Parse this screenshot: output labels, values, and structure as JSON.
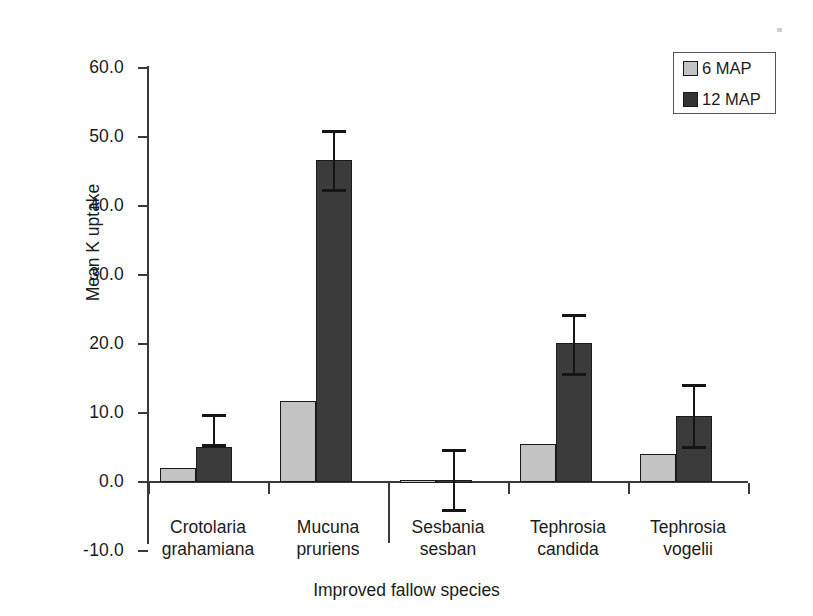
{
  "chart_data": {
    "type": "bar",
    "title": "",
    "xlabel": "Improved fallow species",
    "ylabel": "Mean K uptake",
    "ylim": [
      -10.0,
      60.0
    ],
    "yticks": [
      60.0,
      50.0,
      40.0,
      30.0,
      20.0,
      10.0,
      0.0,
      -10.0
    ],
    "ytick_labels": [
      "60.0",
      "50.0",
      "40.0",
      "30.0",
      "20.0",
      "10.0",
      "0.0",
      "-10.0"
    ],
    "grid": false,
    "legend_position": "top-right",
    "categories": [
      "Crotolaria grahamiana",
      "Mucuna pruriens",
      "Sesbania sesban",
      "Tephrosia candida",
      "Tephrosia vogelii"
    ],
    "category_lines": [
      [
        "Crotolaria",
        "grahamiana"
      ],
      [
        "Mucuna",
        "pruriens"
      ],
      [
        "Sesbania",
        "sesban"
      ],
      [
        "Tephrosia",
        "candida"
      ],
      [
        "Tephrosia",
        "vogelii"
      ]
    ],
    "series": [
      {
        "name": "6 MAP",
        "color": "#c3c3c3",
        "values": [
          2.0,
          11.8,
          0.3,
          5.5,
          4.0
        ],
        "errors": [
          null,
          null,
          null,
          null,
          null
        ]
      },
      {
        "name": "12 MAP",
        "color": "#3b3b3b",
        "values": [
          5.1,
          46.6,
          0.3,
          20.2,
          9.6
        ],
        "err_low": [
          5.1,
          42.0,
          -4.3,
          15.3,
          4.8
        ],
        "err_high": [
          9.8,
          51.0,
          4.8,
          24.4,
          14.2
        ]
      }
    ]
  },
  "legend": {
    "items": [
      {
        "label": "6 MAP",
        "color": "#c3c3c3"
      },
      {
        "label": "12 MAP",
        "color": "#333333"
      }
    ]
  }
}
